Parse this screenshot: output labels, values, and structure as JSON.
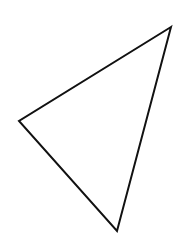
{
  "figure": {
    "shape": "triangle",
    "style": "outline",
    "stroke_color": "#111111",
    "stroke_width": 2,
    "fill": "none",
    "background": "#ffffff",
    "vertices": [
      {
        "name": "top-right",
        "x": 171,
        "y": 27
      },
      {
        "name": "left",
        "x": 19,
        "y": 121
      },
      {
        "name": "bottom",
        "x": 117,
        "y": 231
      }
    ]
  }
}
